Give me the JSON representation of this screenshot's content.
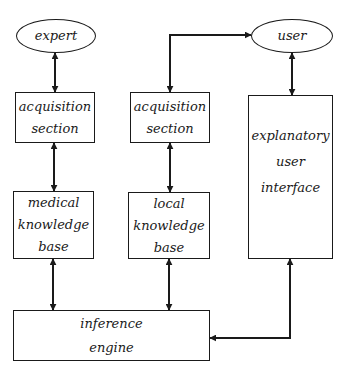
{
  "diagram": {
    "type": "block-diagram",
    "nodes": {
      "expert": {
        "shape": "ellipse",
        "lines": [
          "expert"
        ]
      },
      "user": {
        "shape": "ellipse",
        "lines": [
          "user"
        ]
      },
      "acquisition_left": {
        "shape": "rect",
        "lines": [
          "acquisition",
          "section"
        ]
      },
      "acquisition_right": {
        "shape": "rect",
        "lines": [
          "acquisition",
          "section"
        ]
      },
      "medical_kb": {
        "shape": "rect",
        "lines": [
          "medical",
          "knowledge",
          "base"
        ]
      },
      "local_kb": {
        "shape": "rect",
        "lines": [
          "local",
          "knowledge",
          "base"
        ]
      },
      "explanatory_ui": {
        "shape": "rect",
        "lines": [
          "explanatory",
          "user",
          "interface"
        ]
      },
      "inference_engine": {
        "shape": "rect",
        "lines": [
          "inference",
          "engine"
        ]
      }
    },
    "edges": [
      {
        "from": "expert",
        "to": "acquisition_left",
        "direction": "bidirectional"
      },
      {
        "from": "acquisition_left",
        "to": "medical_kb",
        "direction": "bidirectional"
      },
      {
        "from": "medical_kb",
        "to": "inference_engine",
        "direction": "bidirectional"
      },
      {
        "from": "user",
        "to": "acquisition_right",
        "direction": "bidirectional"
      },
      {
        "from": "acquisition_right",
        "to": "local_kb",
        "direction": "bidirectional"
      },
      {
        "from": "local_kb",
        "to": "inference_engine",
        "direction": "bidirectional"
      },
      {
        "from": "user",
        "to": "explanatory_ui",
        "direction": "bidirectional"
      },
      {
        "from": "explanatory_ui",
        "to": "inference_engine",
        "direction": "bidirectional"
      }
    ],
    "colors": {
      "stroke": "#1a1a1a",
      "background": "#ffffff"
    }
  }
}
